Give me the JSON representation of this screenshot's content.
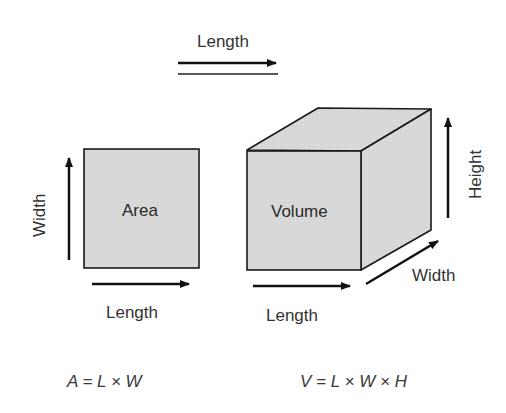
{
  "diagram": {
    "top_label": "Length",
    "area_shape": {
      "inner_label": "Area",
      "side_label": "Width",
      "bottom_label": "Length",
      "formula": "A = L × W"
    },
    "volume_shape": {
      "inner_label": "Volume",
      "height_label": "Height",
      "width_label": "Width",
      "bottom_label": "Length",
      "formula": "V = L × W × H"
    },
    "colors": {
      "fill": "#d9d9d9",
      "side_fill": "#d4d4d4",
      "stroke": "#1a1a1a",
      "text": "#333333"
    }
  }
}
